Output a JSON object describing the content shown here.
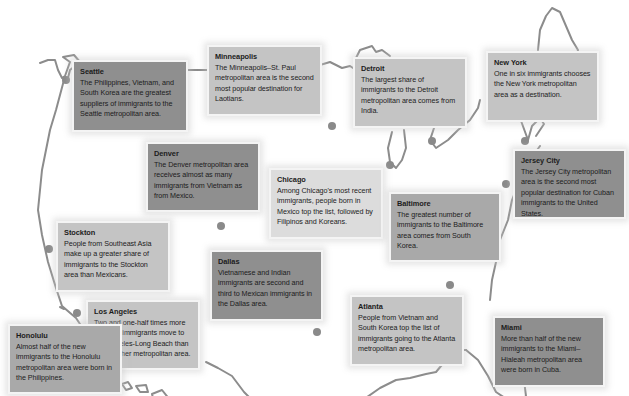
{
  "map": {
    "subject": "U.S. metropolitan areas and their immigrant populations",
    "colors": {
      "outline": "#8c8c8c",
      "dot": "#8a8a8a",
      "box_dark": "#8f8f8f",
      "box_mid": "#a9a9a9",
      "box_light": "#c4c4c4",
      "box_pale": "#dcdcdc"
    },
    "callouts": [
      {
        "city": "Seattle",
        "text": "The Philippines, Vietnam, and South Korea are the greatest suppliers of immigrants to the Seattle metropolitan area."
      },
      {
        "city": "Minneapolis",
        "text": "The Minneapolis–St. Paul metropolitan area is the second most popular destination for Laotians."
      },
      {
        "city": "Detroit",
        "text": "The largest share of immigrants to the Detroit metropolitan area comes from India."
      },
      {
        "city": "New York",
        "text": "One in six immigrants chooses the New York metropolitan area as a destination."
      },
      {
        "city": "Denver",
        "text": "The Denver metropolitan area receives almost as many immigrants from Vietnam as from Mexico."
      },
      {
        "city": "Chicago",
        "text": "Among Chicago's most recent immigrants, people born in Mexico top the list, followed by Filipinos and Koreans."
      },
      {
        "city": "Jersey City",
        "text": "The Jersey City metropolitan area is the second most popular destination for Cuban immigrants to the United States."
      },
      {
        "city": "Baltimore",
        "text": "The greatest number of immigrants to the Baltimore area comes from South Korea."
      },
      {
        "city": "Stockton",
        "text": "People from Southeast Asia make up a greater share of immigrants to the Stockton area than Mexicans."
      },
      {
        "city": "Dallas",
        "text": "Vietnamese and Indian immigrants are second and third to Mexican immigrants in the Dallas area."
      },
      {
        "city": "Los Angeles",
        "text": "Two and one-half times more Mexican immigrants move to Los Angeles-Long Beach than to any other metropolitan area."
      },
      {
        "city": "Atlanta",
        "text": "People from Vietnam and South Korea top the list of immigrants going to the Atlanta metropolitan area."
      },
      {
        "city": "Miami",
        "text": "More than half of the new immigrants to the Miami–Hialeah metropolitan area were born in Cuba."
      },
      {
        "city": "Honolulu",
        "text": "Almost half of the new immigrants to the Honolulu metropolitan area were born in the Philippines."
      }
    ]
  }
}
